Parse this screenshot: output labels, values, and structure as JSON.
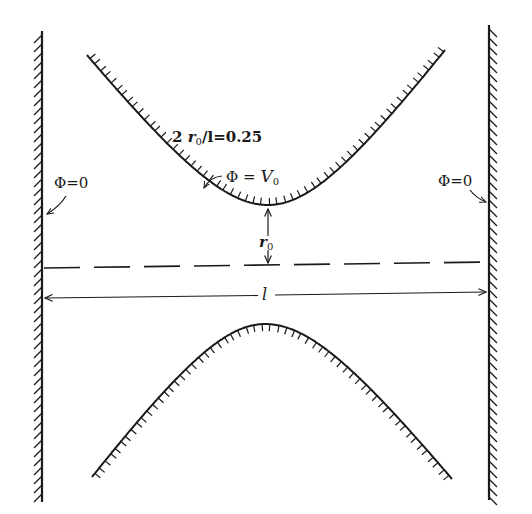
{
  "figure": {
    "type": "electrostatic lens cross-section",
    "background_color": "#ffffff",
    "ink_color": "#1a1a1a"
  },
  "labels": {
    "ratio": {
      "prefix": "2 ",
      "r": "r",
      "r_sub": "0",
      "suffix": "/l=0.25"
    },
    "upper_electrode": {
      "phi": "Φ = ",
      "v": "V",
      "v_sub": "0"
    },
    "left_wall": "Φ=0",
    "right_wall": "Φ=0",
    "gap": {
      "r": "r",
      "r_sub": "0"
    },
    "length": "l"
  },
  "elements": {
    "left_wall": {
      "x": 42,
      "y_top": 31,
      "y_bottom": 502,
      "potential": "0",
      "hatch_side": "left"
    },
    "right_wall": {
      "x": 489,
      "y_top": 25,
      "y_bottom": 500,
      "potential": "0",
      "hatch_side": "right"
    },
    "upper_electrode": {
      "left": [
        87,
        55
      ],
      "vertex": [
        268,
        205
      ],
      "right": [
        445,
        50
      ],
      "potential": "V0"
    },
    "lower_electrode": {
      "left": [
        92,
        477
      ],
      "vertex": [
        265,
        324
      ],
      "right": [
        452,
        479
      ]
    },
    "axis_dashed_line": {
      "y_left": 268,
      "y_right": 262
    },
    "length_dimension": {
      "y_left": 298,
      "y_right": 292,
      "label": "l"
    },
    "gap_dimension": {
      "x": 268,
      "y_top": 207,
      "y_bottom": 265,
      "label": "r0"
    }
  }
}
